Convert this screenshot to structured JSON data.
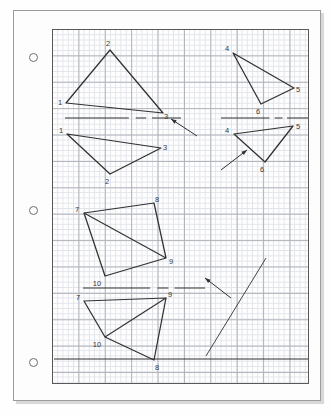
{
  "page": {
    "background_color": "#ffffff",
    "paper_color": "#fdfdfd",
    "frame_color": "#9b9b9b",
    "grid_border_color": "#585858",
    "grid_fine_color": "#dfe2e9",
    "grid_heavy_color": "#a9abb4",
    "ink_color": "#1b1b1b",
    "punch_holes": 3
  },
  "grid": {
    "cell_px": 5.28,
    "heavy_every": 5,
    "width_px": 257,
    "height_px": 355
  },
  "chart_data": {
    "type": "diagram",
    "mirror_lines": [
      {
        "name": "mirror-line-top-left",
        "orientation": "horizontal",
        "x1": 12,
        "y1": 88,
        "x2": 128,
        "y2": 88,
        "style": "solid-with-dash-gap"
      },
      {
        "name": "mirror-line-top-right",
        "orientation": "horizontal",
        "x1": 168,
        "y1": 88,
        "x2": 256,
        "y2": 88,
        "style": "solid-with-dash-gap"
      },
      {
        "name": "mirror-line-middle",
        "orientation": "horizontal",
        "x1": 30,
        "y1": 258,
        "x2": 152,
        "y2": 258,
        "style": "solid-with-dash-gap"
      },
      {
        "name": "mirror-line-diagonal",
        "orientation": "diagonal",
        "x1": 153,
        "y1": 326,
        "x2": 213,
        "y2": 228,
        "style": "solid-thin"
      },
      {
        "name": "rule-line-bottom",
        "orientation": "horizontal",
        "x1": 1,
        "y1": 329,
        "x2": 256,
        "y2": 329,
        "style": "solid"
      }
    ],
    "arrows": [
      {
        "name": "arrow-top-left",
        "from": [
          144,
          106
        ],
        "to": [
          118,
          89
        ],
        "points_at": "mirror-line-top-left"
      },
      {
        "name": "arrow-top-right",
        "from": [
          168,
          140
        ],
        "to": [
          194,
          120
        ],
        "points_at": "triangle-4-5-6-image"
      },
      {
        "name": "arrow-middle",
        "from": [
          178,
          268
        ],
        "to": [
          152,
          248
        ],
        "points_at": "mirror-line-middle"
      }
    ],
    "polygons": [
      {
        "name": "triangle-1-2-3-preimage",
        "region": "top-left-above-mirror",
        "vertices": [
          {
            "label": "1",
            "x": 13,
            "y": 73,
            "label_x": 7,
            "label_y": 73
          },
          {
            "label": "2",
            "x": 57,
            "y": 20,
            "label_x": 55,
            "label_y": 14
          },
          {
            "label": "3",
            "x": 110,
            "y": 83,
            "label_x": 113,
            "label_y": 87
          }
        ]
      },
      {
        "name": "triangle-1-2-3-image",
        "region": "top-left-below-mirror",
        "vertices": [
          {
            "label": "1",
            "x": 14,
            "y": 104,
            "label_x": 8,
            "label_y": 101
          },
          {
            "label": "3",
            "x": 108,
            "y": 118,
            "label_x": 112,
            "label_y": 118
          },
          {
            "label": "2",
            "x": 57,
            "y": 144,
            "label_x": 54,
            "label_y": 152
          }
        ]
      },
      {
        "name": "triangle-4-5-6-preimage",
        "region": "top-right-above-mirror",
        "vertices": [
          {
            "label": "4",
            "x": 180,
            "y": 23,
            "label_x": 174,
            "label_y": 19
          },
          {
            "label": "5",
            "x": 241,
            "y": 58,
            "label_x": 245,
            "label_y": 60
          },
          {
            "label": "6",
            "x": 208,
            "y": 74,
            "label_x": 205,
            "label_y": 82
          }
        ]
      },
      {
        "name": "triangle-4-5-6-image",
        "region": "top-right-below-mirror",
        "vertices": [
          {
            "label": "4",
            "x": 181,
            "y": 104,
            "label_x": 174,
            "label_y": 101
          },
          {
            "label": "5",
            "x": 240,
            "y": 96,
            "label_x": 245,
            "label_y": 97
          },
          {
            "label": "6",
            "x": 212,
            "y": 132,
            "label_x": 209,
            "label_y": 140
          }
        ]
      },
      {
        "name": "quadrilateral-7-8-9-10-preimage",
        "region": "middle-above-mirror",
        "vertices": [
          {
            "label": "7",
            "x": 31,
            "y": 183,
            "label_x": 24,
            "label_y": 180
          },
          {
            "label": "8",
            "x": 101,
            "y": 173,
            "label_x": 104,
            "label_y": 170
          },
          {
            "label": "9",
            "x": 113,
            "y": 228,
            "label_x": 118,
            "label_y": 232
          },
          {
            "label": "10",
            "x": 52,
            "y": 246,
            "label_x": 44,
            "label_y": 254
          }
        ],
        "diagonal": {
          "from": "7",
          "to": "9"
        }
      },
      {
        "name": "quadrilateral-7-9-8-10-image",
        "region": "middle-below-mirror",
        "vertices": [
          {
            "label": "7",
            "x": 31,
            "y": 271,
            "label_x": 25,
            "label_y": 268
          },
          {
            "label": "9",
            "x": 113,
            "y": 268,
            "label_x": 117,
            "label_y": 265
          },
          {
            "label": "8",
            "x": 101,
            "y": 330,
            "label_x": 104,
            "label_y": 338
          },
          {
            "label": "10",
            "x": 52,
            "y": 307,
            "label_x": 44,
            "label_y": 315
          }
        ],
        "diagonal": {
          "from": "9",
          "to": "10"
        }
      }
    ],
    "vertex_labels": [
      "1",
      "2",
      "3",
      "4",
      "5",
      "6",
      "7",
      "8",
      "9",
      "10"
    ]
  }
}
